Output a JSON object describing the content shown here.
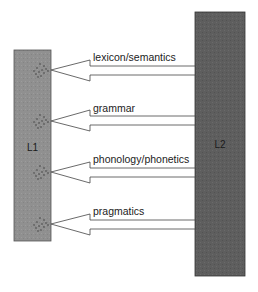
{
  "diagram": {
    "left_block": {
      "label": "L1",
      "color": "#8f8f8f"
    },
    "right_block": {
      "label": "L2",
      "color": "#5c5c5c"
    },
    "arrows": [
      {
        "label": "lexicon/semantics",
        "tip_y": 70
      },
      {
        "label": "grammar",
        "tip_y": 121
      },
      {
        "label": "phonology/phonetics",
        "tip_y": 172
      },
      {
        "label": "pragmatics",
        "tip_y": 224
      }
    ],
    "arrow_direction": "L2 to L1"
  }
}
